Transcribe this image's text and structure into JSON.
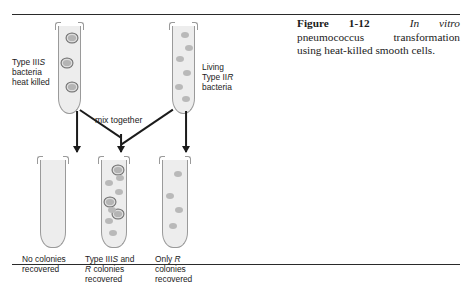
{
  "figure": {
    "caption": {
      "label": "Figure 1-12",
      "italic_lead": "In vitro",
      "rest": "pneumococcus transformation using heat-killed smooth cells."
    },
    "mix_label": "mix together",
    "top_tubes": [
      {
        "id": "heat-killed-s",
        "label_lines": [
          "Type III",
          "bacteria",
          "heat killed"
        ],
        "label_italic": "S",
        "label_line1_prefix": "Type III",
        "label_line1_italic": "S",
        "label_line2": "bacteria",
        "label_line3": "heat killed",
        "colony_type": "smooth-ringed",
        "colony_count": 3
      },
      {
        "id": "living-r",
        "label_line1": "Living",
        "label_line2_prefix": "Type II",
        "label_line2_italic": "R",
        "label_line3": "bacteria",
        "colony_type": "rough-plain",
        "colony_count": 6
      }
    ],
    "bottom_tubes": [
      {
        "id": "no-colonies",
        "label_line1": "No colonies",
        "label_line2": "recovered",
        "label_line3": "",
        "smooth_count": 0,
        "rough_count": 0
      },
      {
        "id": "s-and-r-colonies",
        "label_line1_prefix": "Type III",
        "label_line1_italic": "S",
        "label_line1_suffix": " and",
        "label_line2_italic": "R",
        "label_line2_suffix": " colonies",
        "label_line3": "recovered",
        "smooth_count": 3,
        "rough_count": 6
      },
      {
        "id": "only-r-colonies",
        "label_line1_prefix": "Only ",
        "label_line1_italic": "R",
        "label_line2": "colonies",
        "label_line3": "recovered",
        "smooth_count": 0,
        "rough_count": 4
      }
    ],
    "colors": {
      "tube_fill": "#ededed",
      "tube_stroke": "#9a9a9a",
      "colony_rough": "#b9b9b9",
      "colony_smooth_fill": "#b4b4b4",
      "colony_smooth_ring": "#707070",
      "line": "#1b1b1b",
      "rule": "#2a2a2a"
    }
  }
}
